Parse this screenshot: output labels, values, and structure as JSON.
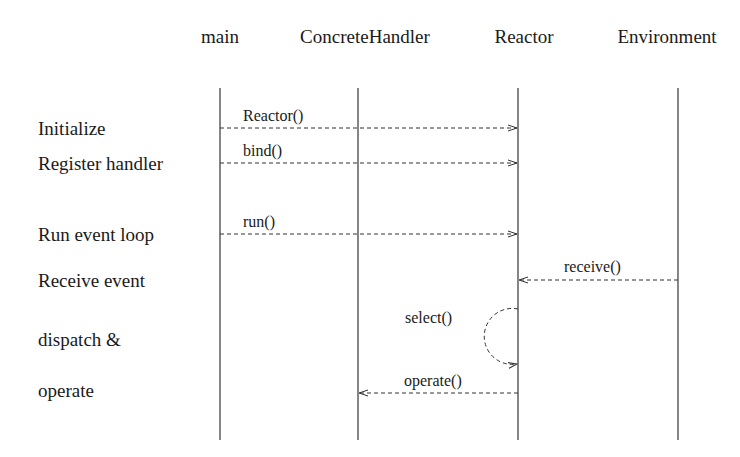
{
  "diagram": {
    "type": "sequence",
    "participants": [
      {
        "id": "main",
        "label": "main",
        "x": 220
      },
      {
        "id": "handler",
        "label": "ConcreteHandler",
        "x": 358
      },
      {
        "id": "reactor",
        "label": "Reactor",
        "x": 518
      },
      {
        "id": "env",
        "label": "Environment",
        "x": 678
      }
    ],
    "steps": [
      {
        "label": "Initialize",
        "y": 118
      },
      {
        "label": "Register handler",
        "y": 153
      },
      {
        "label": "Run event loop",
        "y": 224
      },
      {
        "label": "Receive event",
        "y": 270
      },
      {
        "label": "dispatch &",
        "y": 329
      },
      {
        "label": "operate",
        "y": 380
      }
    ],
    "messages": [
      {
        "label": "Reactor()",
        "from": "main",
        "to": "reactor",
        "y": 128
      },
      {
        "label": "bind()",
        "from": "main",
        "to": "reactor",
        "y": 163
      },
      {
        "label": "run()",
        "from": "main",
        "to": "reactor",
        "y": 234
      },
      {
        "label": "receive()",
        "from": "env",
        "to": "reactor",
        "y": 280
      },
      {
        "label": "select()",
        "from": "reactor",
        "to": "reactor",
        "y": 336,
        "self_loop": true
      },
      {
        "label": "operate()",
        "from": "reactor",
        "to": "handler",
        "y": 393
      }
    ],
    "line_color": "#333333"
  }
}
